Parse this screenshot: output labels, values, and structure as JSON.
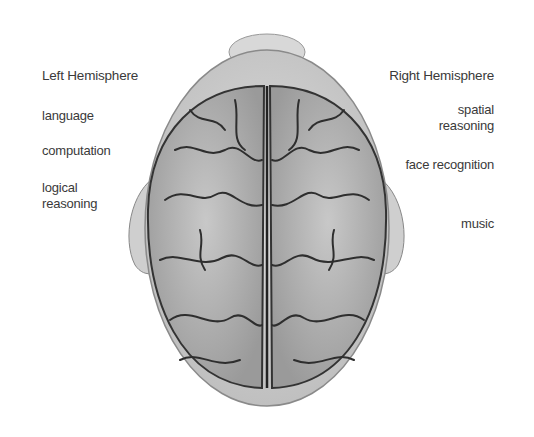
{
  "diagram": {
    "left": {
      "title": "Left Hemisphere",
      "functions": [
        "language",
        "computation",
        "logical reasoning"
      ]
    },
    "right": {
      "title": "Right Hemisphere",
      "functions": [
        "spatial reasoning",
        "face recognition",
        "music"
      ]
    },
    "colors": {
      "brain_fill": "#b8b8b8",
      "head_fill": "#d4d4d4",
      "sulci": "#2e2e2e",
      "text": "#3a3a3a"
    }
  }
}
